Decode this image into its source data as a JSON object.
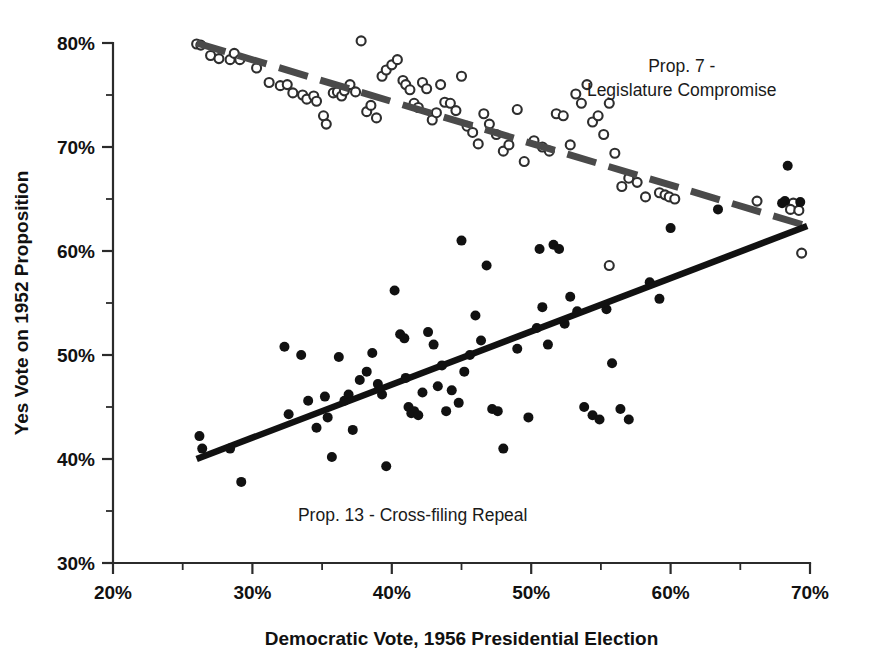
{
  "chart_data": {
    "type": "scatter",
    "title": "",
    "xlabel": "Democratic Vote, 1956 Presidential Election",
    "ylabel": "Yes Vote on 1952 Proposition",
    "xlim": [
      20,
      70
    ],
    "ylim": [
      30,
      80
    ],
    "xticks": [
      20,
      30,
      40,
      50,
      60,
      70
    ],
    "xtick_labels": [
      "20%",
      "30%",
      "40%",
      "50%",
      "60%",
      "70%"
    ],
    "xminor_ticks": [
      25,
      35,
      45,
      55,
      65
    ],
    "yticks": [
      30,
      40,
      50,
      60,
      70,
      80
    ],
    "ytick_labels": [
      "30%",
      "40%",
      "50%",
      "60%",
      "70%",
      "80%"
    ],
    "yminor_ticks": [
      35,
      45,
      55,
      65,
      75
    ],
    "grid": false,
    "legend_position": "inline-annotation",
    "annotations": [
      {
        "name": "prop7-label",
        "lines": [
          "Prop. 7 -",
          "Legislature Compromise"
        ],
        "x": 60.8,
        "y": 77.2,
        "align": "middle"
      },
      {
        "name": "prop13-label",
        "lines": [
          "Prop. 13 - Cross-filing Repeal"
        ],
        "x": 41.5,
        "y": 34.0,
        "align": "middle"
      }
    ],
    "series": [
      {
        "name": "Prop. 7 - Legislature Compromise",
        "marker": "open-circle",
        "marker_color": "#2e2e2e",
        "marker_fill": "#ffffff",
        "marker_size": 9,
        "points": [
          [
            26.0,
            79.9
          ],
          [
            26.3,
            79.8
          ],
          [
            27.0,
            78.8
          ],
          [
            27.6,
            78.5
          ],
          [
            28.4,
            78.4
          ],
          [
            28.7,
            79.0
          ],
          [
            29.1,
            78.4
          ],
          [
            30.3,
            77.6
          ],
          [
            31.2,
            76.2
          ],
          [
            32.0,
            75.9
          ],
          [
            32.5,
            76.0
          ],
          [
            32.9,
            75.2
          ],
          [
            33.6,
            75.0
          ],
          [
            33.9,
            74.6
          ],
          [
            34.4,
            74.9
          ],
          [
            34.6,
            74.4
          ],
          [
            35.1,
            73.0
          ],
          [
            35.3,
            72.2
          ],
          [
            35.8,
            75.2
          ],
          [
            36.1,
            75.3
          ],
          [
            36.4,
            74.9
          ],
          [
            36.6,
            75.4
          ],
          [
            37.0,
            76.0
          ],
          [
            37.4,
            75.3
          ],
          [
            37.8,
            80.2
          ],
          [
            38.2,
            73.4
          ],
          [
            38.5,
            74.0
          ],
          [
            38.9,
            72.8
          ],
          [
            39.3,
            76.8
          ],
          [
            39.6,
            77.4
          ],
          [
            40.0,
            77.9
          ],
          [
            40.4,
            78.4
          ],
          [
            40.8,
            76.4
          ],
          [
            41.0,
            76.0
          ],
          [
            41.3,
            75.5
          ],
          [
            41.6,
            74.2
          ],
          [
            41.9,
            73.8
          ],
          [
            42.2,
            76.2
          ],
          [
            42.5,
            75.6
          ],
          [
            42.9,
            72.6
          ],
          [
            43.2,
            73.3
          ],
          [
            43.5,
            76.0
          ],
          [
            43.8,
            74.3
          ],
          [
            44.2,
            74.2
          ],
          [
            44.6,
            73.5
          ],
          [
            45.0,
            76.8
          ],
          [
            45.4,
            72.0
          ],
          [
            45.8,
            71.4
          ],
          [
            46.2,
            70.3
          ],
          [
            46.6,
            73.2
          ],
          [
            47.0,
            72.2
          ],
          [
            47.5,
            71.2
          ],
          [
            48.0,
            69.6
          ],
          [
            48.4,
            70.2
          ],
          [
            49.0,
            73.6
          ],
          [
            49.5,
            68.6
          ],
          [
            50.2,
            70.6
          ],
          [
            50.8,
            70.0
          ],
          [
            51.3,
            69.6
          ],
          [
            51.8,
            73.2
          ],
          [
            52.3,
            73.0
          ],
          [
            52.8,
            70.2
          ],
          [
            53.2,
            75.1
          ],
          [
            53.6,
            74.2
          ],
          [
            54.0,
            76.0
          ],
          [
            54.4,
            72.4
          ],
          [
            54.8,
            73.0
          ],
          [
            55.2,
            71.2
          ],
          [
            55.6,
            74.2
          ],
          [
            56.0,
            69.4
          ],
          [
            56.5,
            66.2
          ],
          [
            57.0,
            67.0
          ],
          [
            57.6,
            66.6
          ],
          [
            58.2,
            65.2
          ],
          [
            59.2,
            65.6
          ],
          [
            59.6,
            65.4
          ],
          [
            59.9,
            65.2
          ],
          [
            60.3,
            65.0
          ],
          [
            55.6,
            58.6
          ],
          [
            68.8,
            64.6
          ],
          [
            68.6,
            64.0
          ],
          [
            69.2,
            63.9
          ],
          [
            69.4,
            59.8
          ],
          [
            66.2,
            64.8
          ]
        ]
      },
      {
        "name": "Prop. 13 - Cross-filing Repeal",
        "marker": "filled-circle",
        "marker_color": "#111111",
        "marker_size": 10,
        "points": [
          [
            26.2,
            42.2
          ],
          [
            26.4,
            41.0
          ],
          [
            28.4,
            41.0
          ],
          [
            29.2,
            37.8
          ],
          [
            32.3,
            50.8
          ],
          [
            32.6,
            44.3
          ],
          [
            33.5,
            50.0
          ],
          [
            34.0,
            45.6
          ],
          [
            34.6,
            43.0
          ],
          [
            35.2,
            46.0
          ],
          [
            35.4,
            44.0
          ],
          [
            35.7,
            40.2
          ],
          [
            36.2,
            49.8
          ],
          [
            36.6,
            45.6
          ],
          [
            36.9,
            46.2
          ],
          [
            37.2,
            42.8
          ],
          [
            37.7,
            47.6
          ],
          [
            38.2,
            48.4
          ],
          [
            38.6,
            50.2
          ],
          [
            39.0,
            47.2
          ],
          [
            39.3,
            46.2
          ],
          [
            39.6,
            39.3
          ],
          [
            40.2,
            56.2
          ],
          [
            40.6,
            52.0
          ],
          [
            40.9,
            51.6
          ],
          [
            41.0,
            47.8
          ],
          [
            41.2,
            45.0
          ],
          [
            41.4,
            44.4
          ],
          [
            41.6,
            44.6
          ],
          [
            41.9,
            44.2
          ],
          [
            42.2,
            46.4
          ],
          [
            42.6,
            52.2
          ],
          [
            43.0,
            51.0
          ],
          [
            43.3,
            47.0
          ],
          [
            43.6,
            49.0
          ],
          [
            43.9,
            44.6
          ],
          [
            44.3,
            46.6
          ],
          [
            44.8,
            45.4
          ],
          [
            45.2,
            48.4
          ],
          [
            45.6,
            50.0
          ],
          [
            46.0,
            53.8
          ],
          [
            46.4,
            51.4
          ],
          [
            46.8,
            58.6
          ],
          [
            47.2,
            44.8
          ],
          [
            47.6,
            44.6
          ],
          [
            48.0,
            41.0
          ],
          [
            49.0,
            50.6
          ],
          [
            49.8,
            44.0
          ],
          [
            50.4,
            52.6
          ],
          [
            50.8,
            54.6
          ],
          [
            51.2,
            51.0
          ],
          [
            51.6,
            60.6
          ],
          [
            52.0,
            60.2
          ],
          [
            52.4,
            53.0
          ],
          [
            52.8,
            55.6
          ],
          [
            53.3,
            54.2
          ],
          [
            53.8,
            45.0
          ],
          [
            54.4,
            44.2
          ],
          [
            54.9,
            43.8
          ],
          [
            55.4,
            54.4
          ],
          [
            55.8,
            49.2
          ],
          [
            56.4,
            44.8
          ],
          [
            57.0,
            43.8
          ],
          [
            58.5,
            57.0
          ],
          [
            59.2,
            55.4
          ],
          [
            60.0,
            62.2
          ],
          [
            63.4,
            64.0
          ],
          [
            68.4,
            68.2
          ],
          [
            68.2,
            64.8
          ],
          [
            68.0,
            64.6
          ],
          [
            69.3,
            64.7
          ],
          [
            45.0,
            61.0
          ],
          [
            50.6,
            60.2
          ]
        ]
      }
    ],
    "trend_lines": [
      {
        "name": "prop7-trend",
        "style": "dashed",
        "color": "#4a4a4a",
        "width": 7,
        "x1": 26.0,
        "y1": 80.0,
        "x2": 69.8,
        "y2": 62.4
      },
      {
        "name": "prop13-trend",
        "style": "solid",
        "color": "#111111",
        "width": 6.5,
        "x1": 26.0,
        "y1": 40.0,
        "x2": 69.8,
        "y2": 62.4
      }
    ]
  }
}
